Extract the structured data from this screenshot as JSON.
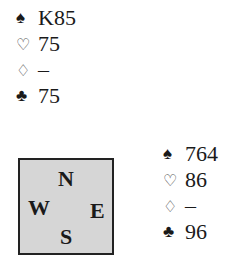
{
  "north": {
    "spades": "K85",
    "hearts": "75",
    "diamonds": "–",
    "clubs": "75"
  },
  "east": {
    "spades": "764",
    "hearts": "86",
    "diamonds": "–",
    "clubs": "96"
  },
  "compass": {
    "n": "N",
    "e": "E",
    "s": "S",
    "w": "W"
  },
  "suit_symbols": {
    "spades": "♠",
    "hearts": "♡",
    "diamonds": "♢",
    "clubs": "♣"
  }
}
